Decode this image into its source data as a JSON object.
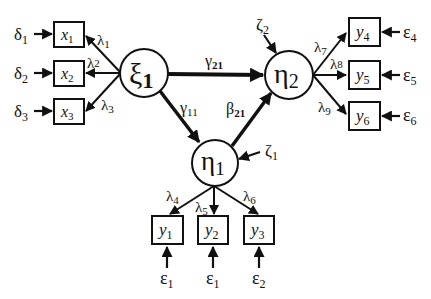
{
  "diagram": {
    "type": "structural-equation-model",
    "colors": {
      "stroke": "#111111",
      "background": "#ffffff"
    },
    "latent": [
      {
        "id": "xi1",
        "symbol": "ξ",
        "sub": "1",
        "cx": 144,
        "cy": 73,
        "r": 24
      },
      {
        "id": "eta2",
        "symbol": "η",
        "sub": "2",
        "cx": 289,
        "cy": 75,
        "r": 24
      },
      {
        "id": "eta1",
        "symbol": "η",
        "sub": "1",
        "cx": 215,
        "cy": 163,
        "r": 23
      }
    ],
    "observed": [
      {
        "id": "x1",
        "symbol": "x",
        "sub": "1",
        "error": "δ",
        "error_sub": "1"
      },
      {
        "id": "x2",
        "symbol": "x",
        "sub": "2",
        "error": "δ",
        "error_sub": "2"
      },
      {
        "id": "x3",
        "symbol": "x",
        "sub": "3",
        "error": "δ",
        "error_sub": "3"
      },
      {
        "id": "y4",
        "symbol": "y",
        "sub": "4",
        "error": "ε",
        "error_sub": "4"
      },
      {
        "id": "y5",
        "symbol": "y",
        "sub": "5",
        "error": "ε",
        "error_sub": "5"
      },
      {
        "id": "y6",
        "symbol": "y",
        "sub": "6",
        "error": "ε",
        "error_sub": "6"
      },
      {
        "id": "y1",
        "symbol": "y",
        "sub": "1",
        "error": "ε",
        "error_sub": "1"
      },
      {
        "id": "y2",
        "symbol": "y",
        "sub": "2",
        "error": "ε",
        "error_sub": "1"
      },
      {
        "id": "y3",
        "symbol": "y",
        "sub": "3",
        "error": "ε",
        "error_sub": "2"
      }
    ],
    "paths": [
      {
        "symbol": "γ",
        "sub": "21",
        "from": "xi1",
        "to": "eta2"
      },
      {
        "symbol": "γ",
        "sub": "11",
        "from": "xi1",
        "to": "eta1"
      },
      {
        "symbol": "β",
        "sub": "21",
        "from": "eta1",
        "to": "eta2"
      }
    ],
    "loadings": [
      {
        "symbol": "λ",
        "sub": "1",
        "from": "xi1",
        "to": "x1"
      },
      {
        "symbol": "λ",
        "sub": "2",
        "from": "xi1",
        "to": "x2"
      },
      {
        "symbol": "λ",
        "sub": "3",
        "from": "xi1",
        "to": "x3"
      },
      {
        "symbol": "λ",
        "sub": "4",
        "from": "eta1",
        "to": "y1"
      },
      {
        "symbol": "λ",
        "sub": "5",
        "from": "eta1",
        "to": "y2"
      },
      {
        "symbol": "λ",
        "sub": "6",
        "from": "eta1",
        "to": "y3"
      },
      {
        "symbol": "λ",
        "sub": "7",
        "from": "eta2",
        "to": "y4"
      },
      {
        "symbol": "λ",
        "sub": "8",
        "from": "eta2",
        "to": "y5"
      },
      {
        "symbol": "λ",
        "sub": "9",
        "from": "eta2",
        "to": "y6"
      }
    ],
    "disturbances": [
      {
        "symbol": "ζ",
        "sub": "1",
        "to": "eta1"
      },
      {
        "symbol": "ζ",
        "sub": "2",
        "to": "eta2"
      }
    ]
  }
}
